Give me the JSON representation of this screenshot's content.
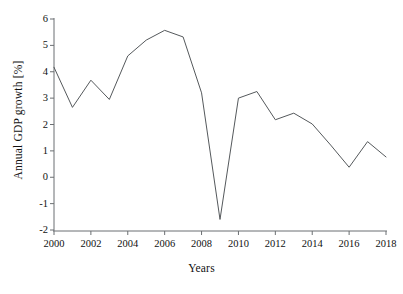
{
  "chart_data": {
    "type": "line",
    "title": "",
    "xlabel": "Years",
    "ylabel": "Annual GDP growth [%]",
    "xlim": [
      2000,
      2018
    ],
    "ylim": [
      -2,
      6
    ],
    "grid": false,
    "legend": "none",
    "x_ticks": [
      2000,
      2002,
      2004,
      2006,
      2008,
      2010,
      2012,
      2014,
      2016,
      2018
    ],
    "y_ticks": [
      -2,
      -1,
      0,
      1,
      2,
      3,
      4,
      5,
      6
    ],
    "x_tick_labels": [
      "2000",
      "2002",
      "2004",
      "2006",
      "2008",
      "2010",
      "2012",
      "2014",
      "2016",
      "2018"
    ],
    "y_tick_labels": [
      "-2",
      "-1",
      "0",
      "1",
      "2",
      "3",
      "4",
      "5",
      "6"
    ],
    "x": [
      2000,
      2001,
      2002,
      2003,
      2004,
      2005,
      2006,
      2007,
      2008,
      2009,
      2010,
      2011,
      2012,
      2013,
      2014,
      2015,
      2016,
      2017,
      2018
    ],
    "series": [
      {
        "name": "Annual GDP growth",
        "color": "#55595c",
        "values": [
          4.17,
          2.65,
          3.68,
          2.95,
          4.6,
          5.2,
          5.57,
          5.32,
          3.2,
          -1.6,
          3.0,
          3.25,
          2.18,
          2.43,
          2.02,
          1.22,
          0.38,
          1.35,
          0.77
        ]
      }
    ]
  },
  "axes": {
    "line_color": "#6b6f72",
    "tick_color": "#6b6f72",
    "text_color": "#111111"
  }
}
